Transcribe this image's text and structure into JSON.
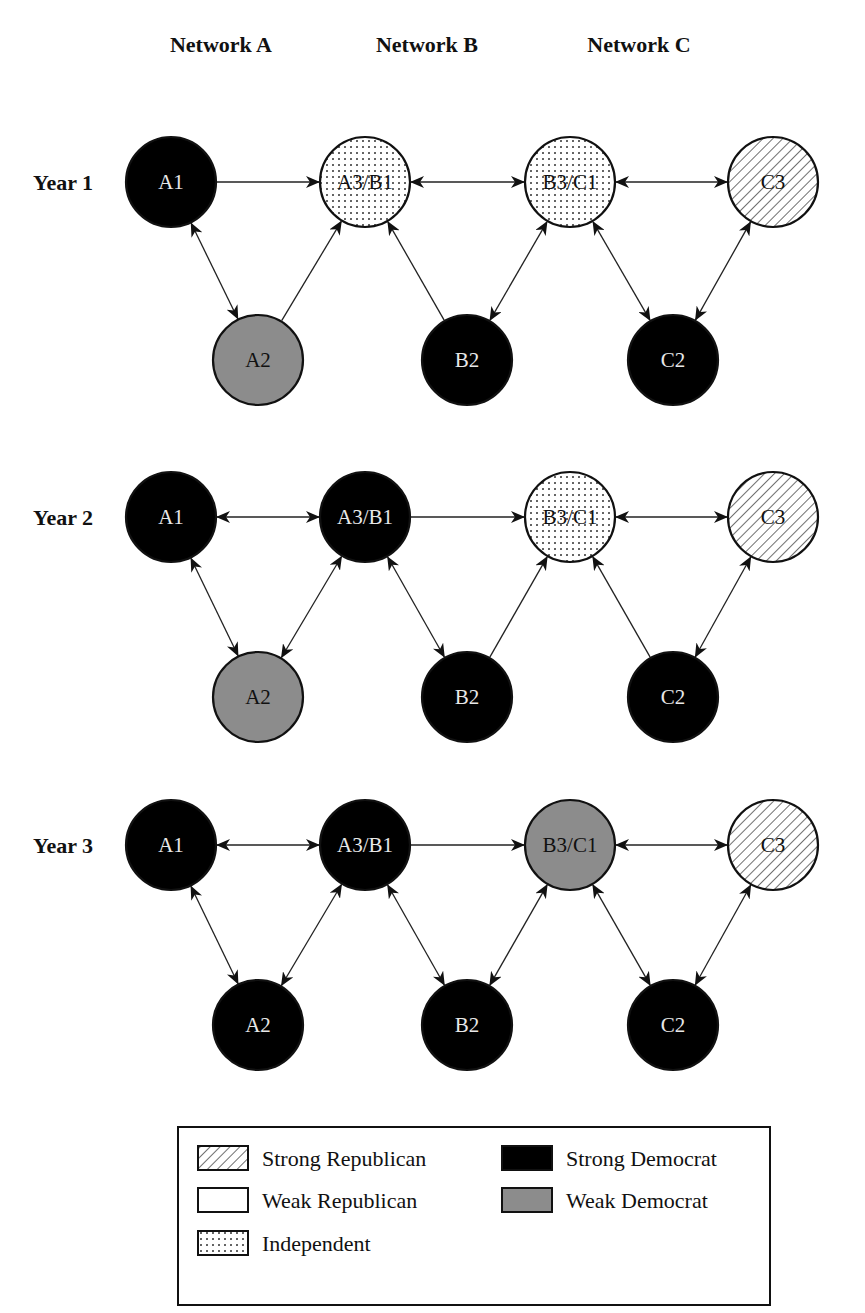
{
  "columns": [
    {
      "label": "Network A",
      "x": 221
    },
    {
      "label": "Network B",
      "x": 427
    },
    {
      "label": "Network C",
      "x": 639
    }
  ],
  "categories": {
    "strong_republican": {
      "label": "Strong Republican",
      "fill": "hatch",
      "text_color": "#111111"
    },
    "weak_republican": {
      "label": "Weak Republican",
      "fill": "#ffffff",
      "text_color": "#111111"
    },
    "independent": {
      "label": "Independent",
      "fill": "dots",
      "text_color": "#111111"
    },
    "strong_democrat": {
      "label": "Strong Democrat",
      "fill": "#000000",
      "text_color": "#e8e8e8"
    },
    "weak_democrat": {
      "label": "Weak Democrat",
      "fill": "#8c8c8c",
      "text_color": "#111111"
    }
  },
  "node_positions": {
    "A1": {
      "x": 171,
      "row": "top"
    },
    "A3/B1": {
      "x": 365,
      "row": "top"
    },
    "B3/C1": {
      "x": 570,
      "row": "top"
    },
    "C3": {
      "x": 773,
      "row": "top"
    },
    "A2": {
      "x": 258,
      "row": "bottom"
    },
    "B2": {
      "x": 467,
      "row": "bottom"
    },
    "C2": {
      "x": 673,
      "row": "bottom"
    }
  },
  "node_radius": 45,
  "years": [
    {
      "label": "Year 1",
      "top_y": 182,
      "bottom_y": 360,
      "nodes": {
        "A1": "strong_democrat",
        "A3/B1": "independent",
        "B3/C1": "independent",
        "C3": "strong_republican",
        "A2": "weak_democrat",
        "B2": "strong_democrat",
        "C2": "strong_democrat"
      },
      "edges": [
        {
          "from": "A1",
          "to": "A3/B1",
          "dir": "forward"
        },
        {
          "from": "A1",
          "to": "A2",
          "dir": "both"
        },
        {
          "from": "A2",
          "to": "A3/B1",
          "dir": "forward"
        },
        {
          "from": "B2",
          "to": "A3/B1",
          "dir": "forward"
        },
        {
          "from": "A3/B1",
          "to": "B3/C1",
          "dir": "both"
        },
        {
          "from": "B2",
          "to": "B3/C1",
          "dir": "both"
        },
        {
          "from": "B3/C1",
          "to": "C2",
          "dir": "both"
        },
        {
          "from": "B3/C1",
          "to": "C3",
          "dir": "both"
        },
        {
          "from": "C2",
          "to": "C3",
          "dir": "both"
        }
      ]
    },
    {
      "label": "Year 2",
      "top_y": 517,
      "bottom_y": 697,
      "nodes": {
        "A1": "strong_democrat",
        "A3/B1": "strong_democrat",
        "B3/C1": "independent",
        "C3": "strong_republican",
        "A2": "weak_democrat",
        "B2": "strong_democrat",
        "C2": "strong_democrat"
      },
      "edges": [
        {
          "from": "A1",
          "to": "A3/B1",
          "dir": "both"
        },
        {
          "from": "A1",
          "to": "A2",
          "dir": "both"
        },
        {
          "from": "A2",
          "to": "A3/B1",
          "dir": "both"
        },
        {
          "from": "A3/B1",
          "to": "B2",
          "dir": "both"
        },
        {
          "from": "A3/B1",
          "to": "B3/C1",
          "dir": "forward"
        },
        {
          "from": "B2",
          "to": "B3/C1",
          "dir": "forward"
        },
        {
          "from": "C2",
          "to": "B3/C1",
          "dir": "forward"
        },
        {
          "from": "B3/C1",
          "to": "C3",
          "dir": "both"
        },
        {
          "from": "C2",
          "to": "C3",
          "dir": "both"
        }
      ]
    },
    {
      "label": "Year 3",
      "top_y": 845,
      "bottom_y": 1025,
      "nodes": {
        "A1": "strong_democrat",
        "A3/B1": "strong_democrat",
        "B3/C1": "weak_democrat",
        "C3": "strong_republican",
        "A2": "strong_democrat",
        "B2": "strong_democrat",
        "C2": "strong_democrat"
      },
      "edges": [
        {
          "from": "A1",
          "to": "A3/B1",
          "dir": "both"
        },
        {
          "from": "A1",
          "to": "A2",
          "dir": "both"
        },
        {
          "from": "A2",
          "to": "A3/B1",
          "dir": "both"
        },
        {
          "from": "A3/B1",
          "to": "B2",
          "dir": "both"
        },
        {
          "from": "A3/B1",
          "to": "B3/C1",
          "dir": "forward"
        },
        {
          "from": "B2",
          "to": "B3/C1",
          "dir": "both"
        },
        {
          "from": "B3/C1",
          "to": "C2",
          "dir": "both"
        },
        {
          "from": "B3/C1",
          "to": "C3",
          "dir": "both"
        },
        {
          "from": "C2",
          "to": "C3",
          "dir": "both"
        }
      ]
    }
  ],
  "legend": {
    "box": {
      "x": 178,
      "y": 1127,
      "width": 592,
      "height": 178
    },
    "items": [
      {
        "key": "strong_republican",
        "label": "Strong Republican",
        "col": 0,
        "row": 0
      },
      {
        "key": "weak_republican",
        "label": "Weak Republican",
        "col": 0,
        "row": 1
      },
      {
        "key": "independent",
        "label": "Independent",
        "col": 0,
        "row": 2
      },
      {
        "key": "strong_democrat",
        "label": "Strong Democrat",
        "col": 1,
        "row": 0
      },
      {
        "key": "weak_democrat",
        "label": "Weak Democrat",
        "col": 1,
        "row": 1
      }
    ]
  }
}
